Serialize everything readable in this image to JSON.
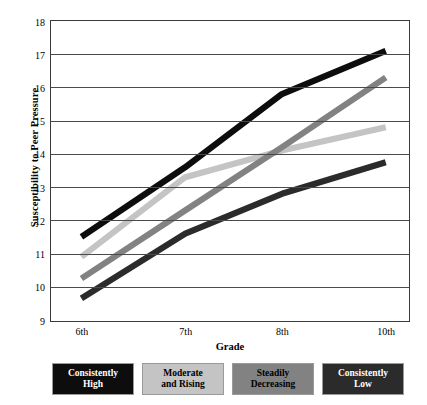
{
  "chart_data": {
    "type": "line",
    "title": "",
    "xlabel": "Grade",
    "ylabel": "Susceptibility to Peer Pressure",
    "categories": [
      "6th",
      "7th",
      "8th",
      "10th"
    ],
    "x_tick_labels": [
      "6th",
      "7th",
      "8th",
      "10th"
    ],
    "y_tick_labels": [
      "9",
      "10",
      "11",
      "12",
      "13",
      "14",
      "15",
      "16",
      "17",
      "18"
    ],
    "ylim": [
      9,
      18
    ],
    "y_tick_step": 1,
    "grid": "horizontal",
    "legend_position": "bottom",
    "series": [
      {
        "name": "Consistently High",
        "color": "#0d0d0d",
        "values": [
          11.5,
          13.6,
          15.8,
          17.1
        ]
      },
      {
        "name": "Moderate and Rising",
        "color": "#c4c4c4",
        "values": [
          10.9,
          13.3,
          14.1,
          14.8
        ]
      },
      {
        "name": "Steadily Decreasing",
        "color": "#828282",
        "values": [
          10.25,
          12.3,
          14.2,
          16.3
        ]
      },
      {
        "name": "Consistently Low",
        "color": "#2b2b2b",
        "values": [
          9.65,
          11.6,
          12.8,
          13.75
        ]
      }
    ]
  },
  "axes": {
    "y_title": "Susceptibility to Peer Pressure",
    "x_title": "Grade",
    "y_ticks": [
      {
        "label": "18",
        "value": 18
      },
      {
        "label": "17",
        "value": 17
      },
      {
        "label": "16",
        "value": 16
      },
      {
        "label": "15",
        "value": 15
      },
      {
        "label": "14",
        "value": 14
      },
      {
        "label": "13",
        "value": 13
      },
      {
        "label": "12",
        "value": 12
      },
      {
        "label": "11",
        "value": 11
      },
      {
        "label": "10",
        "value": 10
      },
      {
        "label": "9",
        "value": 9
      }
    ],
    "x_ticks": [
      {
        "label": "6th"
      },
      {
        "label": "7th"
      },
      {
        "label": "8th"
      },
      {
        "label": "10th"
      }
    ]
  },
  "legend": {
    "items": [
      {
        "line1": "Consistently",
        "line2": "High",
        "swatch": "#0d0d0d",
        "text_color": "#ffffff"
      },
      {
        "line1": "Moderate",
        "line2": "and Rising",
        "swatch": "#c4c4c4",
        "text_color": "#000000"
      },
      {
        "line1": "Steadily",
        "line2": "Decreasing",
        "swatch": "#828282",
        "text_color": "#000000"
      },
      {
        "line1": "Consistently",
        "line2": "Low",
        "swatch": "#2b2b2b",
        "text_color": "#ffffff"
      }
    ]
  }
}
